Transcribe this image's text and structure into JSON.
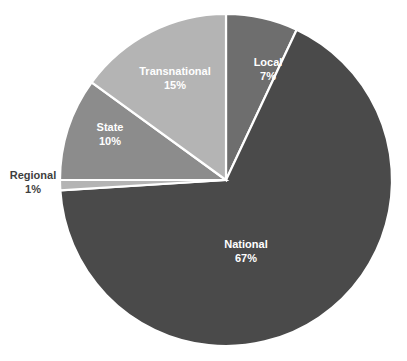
{
  "chart_data": {
    "type": "pie",
    "title": "",
    "subtitle": "",
    "xlabel": "",
    "ylabel": "",
    "grid": false,
    "legend_position": "none",
    "labels_mode": "inside-slice-with-percent",
    "categories": [
      "Local",
      "National",
      "Regional",
      "State",
      "Transnational"
    ],
    "values": [
      7,
      67,
      1,
      10,
      15
    ],
    "value_labels": [
      "7%",
      "67%",
      "1%",
      "10%",
      "15%"
    ],
    "start_angle_deg": 0,
    "direction": "clockwise",
    "slices": [
      {
        "name": "Local",
        "value": 7,
        "value_label": "7%",
        "color": "#6e6e6e",
        "label_color": "#ffffff",
        "label_placement": "inside",
        "label_x": 268,
        "label_y": 66,
        "start_deg": 0,
        "end_deg": 25.2
      },
      {
        "name": "National",
        "value": 67,
        "value_label": "67%",
        "color": "#4a4a4a",
        "label_color": "#ffffff",
        "label_placement": "inside",
        "label_x": 246,
        "label_y": 248,
        "start_deg": 25.2,
        "end_deg": 266.4
      },
      {
        "name": "Regional",
        "value": 1,
        "value_label": "1%",
        "color": "#b4b4b4",
        "label_color": "#3f3f3f",
        "label_placement": "outside-left",
        "label_x": 33,
        "label_y": 179,
        "start_deg": 266.4,
        "end_deg": 270.0
      },
      {
        "name": "State",
        "value": 10,
        "value_label": "10%",
        "color": "#8c8c8c",
        "label_color": "#ffffff",
        "label_placement": "inside",
        "label_x": 110,
        "label_y": 131,
        "start_deg": 270.0,
        "end_deg": 306.0
      },
      {
        "name": "Transnational",
        "value": 15,
        "value_label": "15%",
        "color": "#b4b4b4",
        "label_color": "#ffffff",
        "label_placement": "inside",
        "label_x": 175,
        "label_y": 75,
        "start_deg": 306.0,
        "end_deg": 360.0
      }
    ],
    "geometry": {
      "center_x": 226,
      "center_y": 180,
      "radius": 166
    },
    "background_color": "#ffffff",
    "separator_color": "#ffffff"
  }
}
